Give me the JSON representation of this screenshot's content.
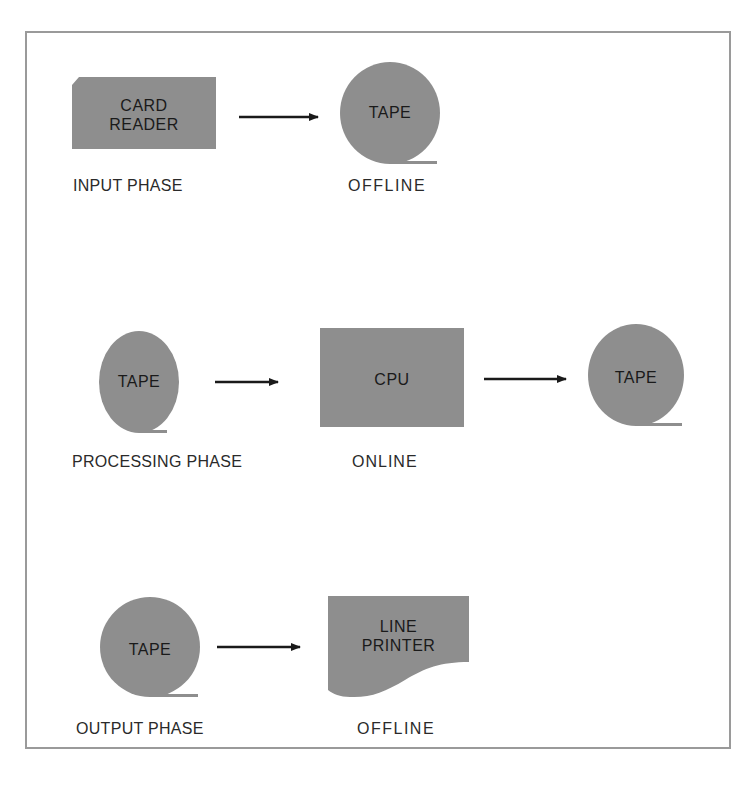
{
  "colors": {
    "shape_fill": "#8e8e8e",
    "arrow": "#1a1a1a",
    "frame_border": "#9a9a9a",
    "text": "#1a1a1a"
  },
  "phases": [
    {
      "name": "input",
      "caption": "INPUT PHASE",
      "mode": "OFFLINE",
      "nodes": [
        {
          "type": "card-reader",
          "lines": [
            "CARD",
            "READER"
          ]
        },
        {
          "type": "tape",
          "lines": [
            "TAPE"
          ]
        }
      ]
    },
    {
      "name": "processing",
      "caption": "PROCESSING PHASE",
      "mode": "ONLINE",
      "nodes": [
        {
          "type": "tape",
          "lines": [
            "TAPE"
          ]
        },
        {
          "type": "cpu",
          "lines": [
            "CPU"
          ]
        },
        {
          "type": "tape",
          "lines": [
            "TAPE"
          ]
        }
      ]
    },
    {
      "name": "output",
      "caption": "OUTPUT PHASE",
      "mode": "OFFLINE",
      "nodes": [
        {
          "type": "tape",
          "lines": [
            "TAPE"
          ]
        },
        {
          "type": "line-printer",
          "lines": [
            "LINE",
            "PRINTER"
          ]
        }
      ]
    }
  ]
}
